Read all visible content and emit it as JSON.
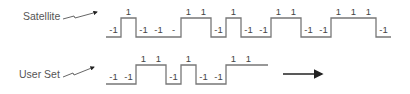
{
  "diagram": {
    "rows": [
      {
        "id": "satellite",
        "label": "Satellite",
        "bits": [
          -1,
          1,
          -1,
          -1,
          -1,
          1,
          1,
          -1,
          1,
          -1,
          -1,
          1,
          1,
          -1,
          -1,
          1,
          1,
          1,
          -1
        ],
        "bit_labels": [
          "-1",
          "1",
          "-1",
          "-1",
          "-",
          "1",
          "1",
          "-1",
          "1",
          "-1",
          "-1",
          "1",
          "1",
          "-1",
          "-1",
          "1",
          "1",
          "1",
          "-1"
        ]
      },
      {
        "id": "user-set",
        "label": "User Set",
        "bits": [
          -1,
          -1,
          1,
          1,
          -1,
          1,
          -1,
          -1,
          1,
          1
        ],
        "bit_labels": [
          "-1",
          "-1",
          "1",
          "1",
          "-1",
          "1",
          "-1",
          "-1",
          "1",
          "1"
        ]
      }
    ],
    "direction_arrow": "right"
  }
}
